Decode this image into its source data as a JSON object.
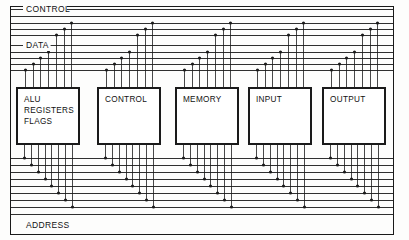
{
  "diagram": {
    "background_color": "#fdfdfc",
    "line_color": "#1a1a1a",
    "buses": [
      {
        "id": "control",
        "label": "CONTROL",
        "label_x": 26,
        "label_y": 12,
        "position": "top",
        "line_count": 4,
        "y_values": [
          16,
          23,
          29,
          35
        ]
      },
      {
        "id": "data",
        "label": "DATA",
        "label_x": 26,
        "label_y": 48,
        "position": "middle",
        "line_count": 4,
        "y_values": [
          52,
          58,
          64,
          70
        ]
      },
      {
        "id": "address",
        "label": "ADDRESS",
        "label_x": 26,
        "label_y": 228,
        "position": "bottom",
        "line_count": 8,
        "y_values": [
          158,
          165,
          172,
          179,
          186,
          193,
          200,
          207
        ]
      }
    ],
    "frame": {
      "x": 10,
      "y": 6,
      "width": 383,
      "height": 228
    },
    "blocks": [
      {
        "id": "alu",
        "lines": [
          "ALU",
          "REGISTERS",
          "FLAGS"
        ],
        "x": 17,
        "y": 88,
        "width": 62,
        "height": 56,
        "top_pins": 7,
        "bottom_pins": 8
      },
      {
        "id": "control-unit",
        "lines": [
          "CONTROL"
        ],
        "x": 98,
        "y": 88,
        "width": 62,
        "height": 56,
        "top_pins": 7,
        "bottom_pins": 8
      },
      {
        "id": "memory",
        "lines": [
          "MEMORY"
        ],
        "x": 176,
        "y": 88,
        "width": 62,
        "height": 56,
        "top_pins": 7,
        "bottom_pins": 8
      },
      {
        "id": "input",
        "lines": [
          "INPUT"
        ],
        "x": 249,
        "y": 88,
        "width": 62,
        "height": 56,
        "top_pins": 7,
        "bottom_pins": 8
      },
      {
        "id": "output",
        "lines": [
          "OUTPUT"
        ],
        "x": 323,
        "y": 88,
        "width": 62,
        "height": 56,
        "top_pins": 7,
        "bottom_pins": 8
      }
    ]
  }
}
